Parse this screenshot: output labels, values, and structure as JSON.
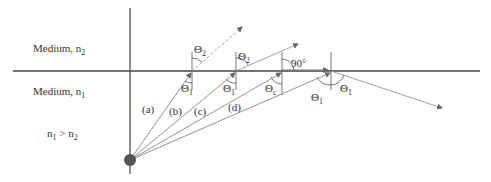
{
  "media": {
    "upper": {
      "label": "Medium, n",
      "subscript": "2"
    },
    "lower": {
      "label": "Medium, n",
      "subscript": "1"
    },
    "condition": {
      "left": "n",
      "left_sub": "1",
      "op": " > ",
      "right": "n",
      "right_sub": "2"
    }
  },
  "rays": [
    {
      "id": "a",
      "label": "(a)",
      "incident_angle": "Θ",
      "incident_sub": "1",
      "refracted_angle": "Θ",
      "refracted_sub": "2"
    },
    {
      "id": "b",
      "label": "(b)",
      "incident_angle": "Θ",
      "incident_sub": "1",
      "refracted_angle": "Θ",
      "refracted_sub": "2"
    },
    {
      "id": "c",
      "label": "(c)",
      "incident_angle": "Θ",
      "incident_sub": "c",
      "refracted_angle": "90°"
    },
    {
      "id": "d",
      "label": "(d)",
      "incident_angle": "Θ",
      "incident_sub": "1",
      "reflected_angle": "Θ",
      "reflected_sub": "1"
    }
  ],
  "colors": {
    "line": "#555555",
    "ray": "#888888",
    "dot": "#555555",
    "text": "#333333"
  }
}
